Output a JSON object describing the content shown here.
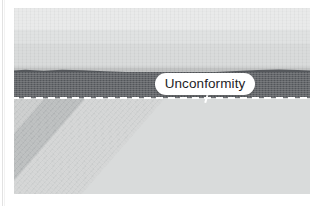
{
  "figure": {
    "title": "Unconformity",
    "type": "geologic-cross-section",
    "annotation": {
      "label": "Unconformity",
      "pill_color": "#ffffff",
      "text_color": "#1d1d1f",
      "leader_color": "#ffffff"
    },
    "unconformity_line": {
      "style": "dashed",
      "color": "#ffffff"
    },
    "upper_strata": [
      {
        "name": "upper-bed-1",
        "color": "#e6e7e7",
        "top": 0,
        "height": 22
      },
      {
        "name": "upper-bed-2",
        "color": "#dcdede",
        "top": 22,
        "height": 14
      },
      {
        "name": "upper-bed-3",
        "color": "#d4d6d6",
        "top": 36,
        "height": 22
      },
      {
        "name": "upper-bed-4",
        "color": "#cbcdcd",
        "top": 58,
        "height": 8
      },
      {
        "name": "upper-bed-5",
        "color": "#b9bbbb",
        "top": 60,
        "height": 6
      }
    ],
    "dark_bed": {
      "name": "dark-bed",
      "color": "#55585c",
      "top": 64,
      "height": 26
    },
    "lower_strata": [
      {
        "name": "tilted-bed-1",
        "color": "#b5b7b7",
        "offset": -230,
        "width": 44
      },
      {
        "name": "tilted-bed-2",
        "color": "#6d7073",
        "offset": -186,
        "width": 40
      },
      {
        "name": "tilted-bed-3",
        "color": "#c9cbcb",
        "offset": -146,
        "width": 18
      },
      {
        "name": "tilted-bed-4",
        "color": "#93999c",
        "offset": -128,
        "width": 42
      },
      {
        "name": "tilted-bed-5",
        "color": "#b0b4b6",
        "offset": -86,
        "width": 34
      },
      {
        "name": "tilted-bed-6",
        "color": "#c6c8c8",
        "offset": -52,
        "width": 30
      },
      {
        "name": "tilted-bed-7",
        "color": "#aeb2b4",
        "offset": -22,
        "width": 40
      },
      {
        "name": "tilted-bed-8",
        "color": "#cbcdcd",
        "offset": 18,
        "width": 34
      },
      {
        "name": "tilted-bed-9",
        "color": "#9aa0a3",
        "offset": 52,
        "width": 16
      },
      {
        "name": "tilted-bed-10",
        "color": "#c3c5c5",
        "offset": 68,
        "width": 46
      },
      {
        "name": "tilted-bed-11",
        "color": "#d2d4d4",
        "offset": 114,
        "width": 30
      },
      {
        "name": "tilted-bed-12",
        "color": "#a9aeb0",
        "offset": 144,
        "width": 26
      },
      {
        "name": "tilted-bed-13",
        "color": "#c8caca",
        "offset": 170,
        "width": 44
      },
      {
        "name": "tilted-bed-14",
        "color": "#b6b9ba",
        "offset": 214,
        "width": 40
      },
      {
        "name": "tilted-bed-15",
        "color": "#d0d2d2",
        "offset": 254,
        "width": 60
      }
    ]
  }
}
